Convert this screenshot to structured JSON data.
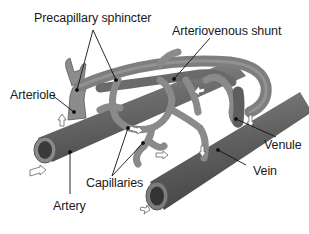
{
  "diagram": {
    "labels": {
      "precapillary_sphincter": "Precapillary sphincter",
      "arteriovenous_shunt": "Arteriovenous shunt",
      "arteriole": "Arteriole",
      "venule": "Venule",
      "vein": "Vein",
      "capillaries": "Capillaries",
      "artery": "Artery"
    },
    "colors": {
      "vessel_fill": "#7a7a7a",
      "vessel_dark": "#4a4a4a",
      "vessel_light": "#a8a8a8",
      "leader_line": "#111111",
      "background": "#ffffff"
    }
  }
}
